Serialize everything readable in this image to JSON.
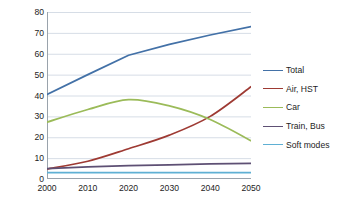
{
  "chart_data": {
    "type": "line",
    "title": "",
    "xlabel": "",
    "ylabel": "Kilomtre per day per person",
    "x": [
      2000,
      2010,
      2020,
      2030,
      2040,
      2050
    ],
    "xlim": [
      2000,
      2050
    ],
    "ylim": [
      0,
      80
    ],
    "xticks": [
      "2000",
      "2010",
      "2020",
      "2030",
      "2040",
      "2050"
    ],
    "yticks": [
      "0",
      "10",
      "20",
      "30",
      "40",
      "50",
      "60",
      "70",
      "80"
    ],
    "grid": "horizontal",
    "legend_position": "right",
    "series": [
      {
        "name": "Total",
        "color": "#4371a7",
        "values": [
          40.5,
          50.0,
          59.3,
          64.5,
          69.0,
          73.0
        ]
      },
      {
        "name": "Air, HST",
        "color": "#9e3a33",
        "values": [
          4.8,
          8.5,
          14.5,
          21.0,
          30.0,
          44.2
        ]
      },
      {
        "name": "Car",
        "color": "#9bbb59",
        "values": [
          27.2,
          33.3,
          38.0,
          35.0,
          28.5,
          18.3
        ]
      },
      {
        "name": "Train, Bus",
        "color": "#5e5074",
        "values": [
          5.0,
          5.8,
          6.4,
          6.8,
          7.2,
          7.5
        ]
      },
      {
        "name": "Soft modes",
        "color": "#5fb0d4",
        "values": [
          3.1,
          3.1,
          3.1,
          3.1,
          3.1,
          3.1
        ]
      }
    ]
  },
  "style": {
    "grid_color": "#d6dde6",
    "axis_color": "#9aa3ac",
    "background": "#ffffff"
  }
}
